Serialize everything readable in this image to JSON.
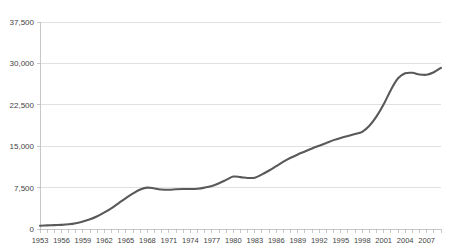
{
  "chart_data": {
    "type": "line",
    "title": "",
    "xlabel": "",
    "ylabel": "",
    "ylim": [
      0,
      37500
    ],
    "ytick_values": [
      0,
      7500,
      15000,
      22500,
      30000,
      37500
    ],
    "ytick_labels": [
      "0",
      "7,500",
      "15,000",
      "22,500",
      "30,000",
      "37,500"
    ],
    "grid": true,
    "legend": "none",
    "series_color": "#595959",
    "xtick_labels": [
      "1953",
      "1956",
      "1959",
      "1962",
      "1965",
      "1968",
      "1971",
      "1974",
      "1977",
      "1980",
      "1983",
      "1986",
      "1989",
      "1992",
      "1995",
      "1998",
      "2001",
      "2004",
      "2007"
    ],
    "xtick_interval_years": 3,
    "x": [
      1953,
      1954,
      1955,
      1956,
      1957,
      1958,
      1959,
      1960,
      1961,
      1962,
      1963,
      1964,
      1965,
      1966,
      1967,
      1968,
      1969,
      1970,
      1971,
      1972,
      1973,
      1974,
      1975,
      1976,
      1977,
      1978,
      1979,
      1980,
      1981,
      1982,
      1983,
      1984,
      1985,
      1986,
      1987,
      1988,
      1989,
      1990,
      1991,
      1992,
      1993,
      1994,
      1995,
      1996,
      1997,
      1998,
      1999,
      2000,
      2001,
      2002,
      2003,
      2004,
      2005,
      2006,
      2007,
      2008,
      2009
    ],
    "series": [
      {
        "name": "Value",
        "values": [
          600,
          650,
          700,
          750,
          850,
          1050,
          1350,
          1750,
          2300,
          3000,
          3800,
          4700,
          5600,
          6450,
          7150,
          7500,
          7350,
          7150,
          7100,
          7200,
          7250,
          7250,
          7300,
          7500,
          7800,
          8300,
          8900,
          9500,
          9400,
          9250,
          9300,
          9900,
          10600,
          11400,
          12200,
          12900,
          13500,
          14050,
          14600,
          15100,
          15600,
          16100,
          16500,
          16850,
          17200,
          17600,
          18700,
          20400,
          22600,
          25200,
          27300,
          28200,
          28300,
          28000,
          27950,
          28400,
          29200
        ]
      }
    ]
  },
  "axes": {
    "plot_left": 40,
    "plot_right": 441,
    "plot_top": 22,
    "plot_bottom": 229
  }
}
